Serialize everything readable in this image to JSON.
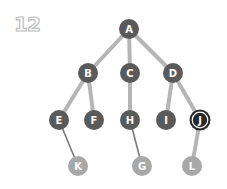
{
  "figure_number": "12",
  "colors": {
    "node_dark": "#5a5a5a",
    "node_light": "#a8a8a8",
    "edge_light": "#b5b5b5",
    "edge_dark": "#7a7a7a",
    "highlight_ring": "#ffffff",
    "highlight_fill": "#2a2a2a",
    "number_stroke": "#bdbdbd"
  },
  "tree": {
    "nodes": [
      {
        "id": "A",
        "label": "A",
        "x": 129,
        "y": 29,
        "style": "dark"
      },
      {
        "id": "B",
        "label": "B",
        "x": 88,
        "y": 73,
        "style": "dark"
      },
      {
        "id": "C",
        "label": "C",
        "x": 130,
        "y": 73,
        "style": "dark"
      },
      {
        "id": "D",
        "label": "D",
        "x": 173,
        "y": 73,
        "style": "dark"
      },
      {
        "id": "E",
        "label": "E",
        "x": 59,
        "y": 120,
        "style": "dark"
      },
      {
        "id": "F",
        "label": "F",
        "x": 94,
        "y": 120,
        "style": "dark"
      },
      {
        "id": "H",
        "label": "H",
        "x": 130,
        "y": 120,
        "style": "dark"
      },
      {
        "id": "I",
        "label": "I",
        "x": 166,
        "y": 120,
        "style": "dark"
      },
      {
        "id": "J",
        "label": "J",
        "x": 200,
        "y": 120,
        "style": "highlight"
      },
      {
        "id": "K",
        "label": "K",
        "x": 78,
        "y": 166,
        "style": "light"
      },
      {
        "id": "G",
        "label": "G",
        "x": 142,
        "y": 166,
        "style": "light"
      },
      {
        "id": "L",
        "label": "L",
        "x": 192,
        "y": 166,
        "style": "light"
      }
    ],
    "edges": [
      {
        "from": "A",
        "to": "B",
        "style": "thick"
      },
      {
        "from": "A",
        "to": "C",
        "style": "thick"
      },
      {
        "from": "A",
        "to": "D",
        "style": "thick"
      },
      {
        "from": "B",
        "to": "E",
        "style": "thick"
      },
      {
        "from": "B",
        "to": "F",
        "style": "thick"
      },
      {
        "from": "C",
        "to": "H",
        "style": "thick"
      },
      {
        "from": "D",
        "to": "I",
        "style": "thick"
      },
      {
        "from": "D",
        "to": "J",
        "style": "thick"
      },
      {
        "from": "E",
        "to": "K",
        "style": "thin"
      },
      {
        "from": "H",
        "to": "G",
        "style": "thin"
      },
      {
        "from": "J",
        "to": "L",
        "style": "thick"
      }
    ]
  }
}
